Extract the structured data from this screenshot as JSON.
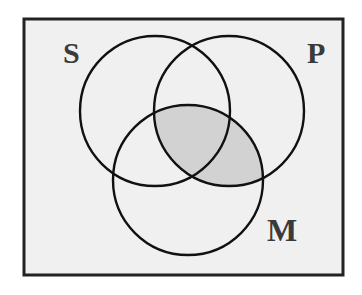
{
  "diagram": {
    "type": "venn",
    "sets": [
      {
        "id": "S",
        "label": "S",
        "cx": 155,
        "cy": 111,
        "r": 75,
        "label_x": 63,
        "label_y": 63
      },
      {
        "id": "P",
        "label": "P",
        "cx": 229,
        "cy": 111,
        "r": 75,
        "label_x": 307,
        "label_y": 63
      },
      {
        "id": "M",
        "label": "M",
        "cx": 188,
        "cy": 180,
        "r": 75,
        "label_x": 267,
        "label_y": 241
      }
    ],
    "shaded_regions": [
      "P ∩ M"
    ],
    "universe": {
      "x": 24,
      "y": 19,
      "width": 319,
      "height": 256
    },
    "colors": {
      "background": "#f0f0f0",
      "shade": "#d2d2d2",
      "stroke": "#111111",
      "frame": "#222222",
      "label": "#3a3a3a"
    }
  }
}
